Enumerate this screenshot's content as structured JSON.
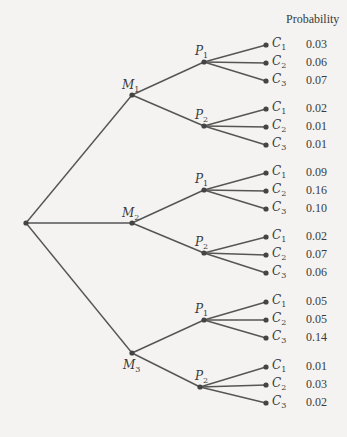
{
  "header": {
    "probability_label": "Probability"
  },
  "colors": {
    "line": "#555555",
    "node": "#444444",
    "text": "#3a3a3a",
    "background": "#f4f3f1"
  },
  "tree": {
    "root": {
      "x": 26,
      "y": 223
    },
    "branches": [
      {
        "label": "M",
        "sub": "1",
        "x": 132,
        "y": 95,
        "lx": 122,
        "ly": 78,
        "children": [
          {
            "label": "P",
            "sub": "1",
            "x": 204,
            "y": 62,
            "lx": 195,
            "ly": 44,
            "leaves": [
              {
                "label": "C",
                "sub": "1",
                "y": 45,
                "p": "0.03"
              },
              {
                "label": "C",
                "sub": "2",
                "y": 63,
                "p": "0.06"
              },
              {
                "label": "C",
                "sub": "3",
                "y": 81,
                "p": "0.07"
              }
            ]
          },
          {
            "label": "P",
            "sub": "2",
            "x": 204,
            "y": 126,
            "lx": 195,
            "ly": 108,
            "leaves": [
              {
                "label": "C",
                "sub": "1",
                "y": 109,
                "p": "0.02"
              },
              {
                "label": "C",
                "sub": "2",
                "y": 127,
                "p": "0.01"
              },
              {
                "label": "C",
                "sub": "3",
                "y": 145,
                "p": "0.01"
              }
            ]
          }
        ]
      },
      {
        "label": "M",
        "sub": "2",
        "x": 132,
        "y": 223,
        "lx": 122,
        "ly": 206,
        "children": [
          {
            "label": "P",
            "sub": "1",
            "x": 204,
            "y": 190,
            "lx": 195,
            "ly": 172,
            "leaves": [
              {
                "label": "C",
                "sub": "1",
                "y": 173,
                "p": "0.09"
              },
              {
                "label": "C",
                "sub": "2",
                "y": 191,
                "p": "0.16"
              },
              {
                "label": "C",
                "sub": "3",
                "y": 209,
                "p": "0.10"
              }
            ]
          },
          {
            "label": "P",
            "sub": "2",
            "x": 204,
            "y": 253,
            "lx": 195,
            "ly": 235,
            "leaves": [
              {
                "label": "C",
                "sub": "1",
                "y": 237,
                "p": "0.02"
              },
              {
                "label": "C",
                "sub": "2",
                "y": 255,
                "p": "0.07"
              },
              {
                "label": "C",
                "sub": "3",
                "y": 273,
                "p": "0.06"
              }
            ]
          }
        ]
      },
      {
        "label": "M",
        "sub": "3",
        "x": 132,
        "y": 353,
        "lx": 123,
        "ly": 358,
        "children": [
          {
            "label": "P",
            "sub": "1",
            "x": 204,
            "y": 320,
            "lx": 195,
            "ly": 302,
            "leaves": [
              {
                "label": "C",
                "sub": "1",
                "y": 302,
                "p": "0.05"
              },
              {
                "label": "C",
                "sub": "2",
                "y": 320,
                "p": "0.05"
              },
              {
                "label": "C",
                "sub": "3",
                "y": 338,
                "p": "0.14"
              }
            ]
          },
          {
            "label": "P",
            "sub": "2",
            "x": 200,
            "y": 387,
            "lx": 195,
            "ly": 369,
            "leaves": [
              {
                "label": "C",
                "sub": "1",
                "y": 367,
                "p": "0.01"
              },
              {
                "label": "C",
                "sub": "2",
                "y": 385,
                "p": "0.03"
              },
              {
                "label": "C",
                "sub": "3",
                "y": 403,
                "p": "0.02"
              }
            ]
          }
        ]
      }
    ],
    "leaf_x": 266,
    "leaf_label_x": 272,
    "prob_x": 306
  }
}
